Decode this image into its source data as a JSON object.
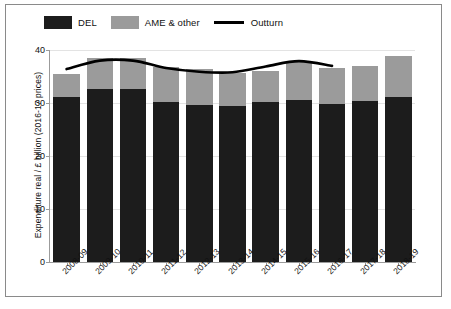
{
  "chart_data": {
    "type": "bar",
    "title": "",
    "xlabel": "",
    "ylabel": "Expenditure real / £ billion (2016-17 prices)",
    "ylim": [
      0,
      40
    ],
    "yticks": [
      0,
      10,
      20,
      30,
      40
    ],
    "grid": true,
    "legend_position": "top-left",
    "stacked": true,
    "categories": [
      "2008-09",
      "2009-10",
      "2010-11",
      "2011-12",
      "2012-13",
      "2013-14",
      "2014-15",
      "2015-16",
      "2016-17",
      "2017-18",
      "2018-19"
    ],
    "series": [
      {
        "name": "DEL",
        "color": "#1c1c1c",
        "values": [
          31.2,
          32.7,
          32.6,
          30.2,
          29.7,
          29.4,
          30.1,
          30.6,
          29.9,
          30.4,
          31.2
        ]
      },
      {
        "name": "AME & other",
        "color": "#9b9b9b",
        "values": [
          4.3,
          5.8,
          5.8,
          6.5,
          6.7,
          6.2,
          5.9,
          7.1,
          6.7,
          6.5,
          7.6
        ]
      }
    ],
    "overlay": {
      "name": "Outturn",
      "type": "line",
      "color": "#000000",
      "x": [
        "2008-09",
        "2009-10",
        "2010-11",
        "2011-12",
        "2012-13",
        "2013-14",
        "2014-15",
        "2015-16",
        "2016-17"
      ],
      "values": [
        36.4,
        38.0,
        38.0,
        36.6,
        35.9,
        35.8,
        36.9,
        37.9,
        37.0
      ]
    }
  },
  "legend": {
    "items": [
      {
        "label": "DEL",
        "marker": "swatch-dark"
      },
      {
        "label": "AME & other",
        "marker": "swatch-gray"
      },
      {
        "label": "Outturn",
        "marker": "line-black"
      }
    ]
  },
  "axes": {
    "y": {
      "title": "Expenditure real / £ billion (2016-17 prices)",
      "ticks": [
        "0",
        "10",
        "20",
        "30",
        "40"
      ]
    },
    "x": {
      "ticks": [
        "2008-09",
        "2009-10",
        "2010-11",
        "2011-12",
        "2012-13",
        "2013-14",
        "2014-15",
        "2015-16",
        "2016-17",
        "2017-18",
        "2018-19"
      ]
    }
  }
}
